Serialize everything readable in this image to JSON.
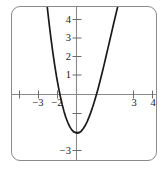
{
  "figure": {
    "frame": {
      "stroke": "#8a8a8a",
      "radius": 9
    },
    "axis_color": "#8a8a8a",
    "curve_color": "#1a1a1a",
    "background": "#ffffff"
  },
  "chart_data": {
    "type": "line",
    "title": "",
    "subtitle": "",
    "xlabel": "",
    "ylabel": "",
    "xlim": [
      -3.45,
      4.6
    ],
    "ylim": [
      -3.9,
      4.4
    ],
    "xticks": [
      -3,
      -2,
      3,
      4
    ],
    "yticks": [
      4,
      3,
      2,
      1,
      -3
    ],
    "xtick_labels": [
      "−3",
      "−2",
      "3",
      "4"
    ],
    "ytick_labels": [
      "4",
      "3",
      "2",
      "1",
      "−3"
    ],
    "unlabeled_xticks": [],
    "unlabeled_yticks": [
      -1,
      -2
    ],
    "grid": false,
    "legend": null,
    "annotations": [],
    "series": [
      {
        "name": "cubic",
        "equation": "y = -x^3 + 2x^2 + 2x - 2",
        "x": [
          -1.95,
          -1.85,
          -1.75,
          -1.65,
          -1.55,
          -1.45,
          -1.35,
          -1.25,
          -1.15,
          -1.05,
          -0.95,
          -0.85,
          -0.75,
          -0.65,
          -0.55,
          -0.45,
          -0.35,
          -0.25,
          -0.15,
          -0.05,
          0.05,
          0.15,
          0.25,
          0.35,
          0.45,
          0.55,
          0.65,
          0.75,
          0.85,
          0.95,
          1.05,
          1.15,
          1.25,
          1.35,
          1.45,
          1.55,
          1.65,
          1.75,
          1.85,
          1.95,
          2.05,
          2.15,
          2.25,
          2.35,
          2.45,
          2.55,
          2.65,
          2.75,
          2.85,
          2.95,
          3.05,
          3.15
        ],
        "y": [
          9.17,
          7.98,
          6.86,
          5.81,
          4.83,
          3.92,
          3.07,
          2.3,
          1.6,
          0.96,
          0.4,
          -0.11,
          -0.55,
          -0.94,
          -1.27,
          -1.53,
          -1.75,
          -1.91,
          -2.01,
          -2.06,
          -2.09,
          -2.06,
          -1.98,
          -1.85,
          -1.69,
          -1.49,
          -1.25,
          -0.98,
          -0.68,
          -0.35,
          0.0,
          0.37,
          0.77,
          1.18,
          1.6,
          2.04,
          2.48,
          2.92,
          3.36,
          3.81,
          4.24,
          4.67,
          5.08,
          5.47,
          5.84,
          6.18,
          6.49,
          6.76,
          6.99,
          7.17,
          7.3,
          7.37
        ]
      }
    ],
    "features": {
      "local_minimum": {
        "x": -0.15,
        "y": -2.1
      },
      "local_maximum": {
        "x": 1.65,
        "y": 0.8
      },
      "x_intercepts": [
        -1.3,
        0.8,
        2.5
      ],
      "y_intercept": -2.1,
      "end_behavior": "rises steeply on the left, falls steeply on the right"
    }
  }
}
